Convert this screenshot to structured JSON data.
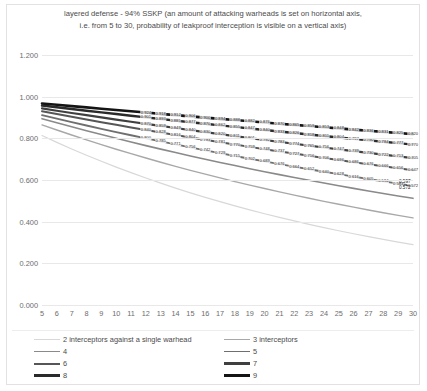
{
  "chart": {
    "title": "layered defense - 94% SSKP (an amount of attacking warheads is set on horizontal axis, i.e. from 5 to 30, probability of leakproof interception is visible on a vertical axis)",
    "title_line1": "layered defense - 94% SSKP (an amount of attacking warheads is set on horizontal axis,",
    "title_line2": "i.e. from 5 to 30, probability of leakproof interception is visible on a vertical axis)"
  },
  "legend": {
    "position": "bottom",
    "items": [
      {
        "label": "2 interceptors against a single warhead",
        "color": "#d8d8d8",
        "width": 1.2
      },
      {
        "label": "3 interceptors",
        "color": "#a8a8a8",
        "width": 1.4
      },
      {
        "label": "4",
        "color": "#8a8a8a",
        "width": 1.6
      },
      {
        "label": "5",
        "color": "#6f6f6f",
        "width": 1.8
      },
      {
        "label": "6",
        "color": "#565656",
        "width": 2.0
      },
      {
        "label": "7",
        "color": "#3f3f3f",
        "width": 2.2
      },
      {
        "label": "8",
        "color": "#2a2a2a",
        "width": 2.4
      },
      {
        "label": "9",
        "color": "#141414",
        "width": 2.6
      }
    ]
  },
  "chart_data": {
    "type": "line",
    "title": "layered defense - 94% SSKP (an amount of attacking warheads is set on horizontal axis, i.e. from 5 to 30, probability of leakproof interception is visible on a vertical axis)",
    "xlabel": "",
    "ylabel": "",
    "xlim": [
      5,
      30
    ],
    "ylim": [
      0.0,
      1.2
    ],
    "yticks": [
      "0.000",
      "0.200",
      "0.400",
      "0.600",
      "0.800",
      "1.000",
      "1.200"
    ],
    "ytick_values": [
      0.0,
      0.2,
      0.4,
      0.6,
      0.8,
      1.0,
      1.2
    ],
    "xticks": [
      5,
      6,
      7,
      8,
      9,
      10,
      11,
      12,
      13,
      14,
      15,
      16,
      17,
      18,
      19,
      20,
      21,
      22,
      23,
      24,
      25,
      26,
      27,
      28,
      29,
      30
    ],
    "grid": true,
    "legend_position": "bottom",
    "x": [
      5,
      6,
      7,
      8,
      9,
      10,
      11,
      12,
      13,
      14,
      15,
      16,
      17,
      18,
      19,
      20,
      21,
      22,
      23,
      24,
      25,
      26,
      27,
      28,
      29,
      30
    ],
    "series": [
      {
        "name": "2 interceptors against a single warhead",
        "color": "#d8d8d8",
        "values": [
          0.983,
          0.979,
          0.976,
          0.972,
          0.968,
          0.965,
          0.961,
          0.957,
          0.954,
          0.95,
          0.946,
          0.943,
          0.939,
          0.936,
          0.932,
          0.929,
          0.925,
          0.921,
          0.918,
          0.914,
          0.911,
          0.907,
          0.904,
          0.9,
          0.897,
          0.893
        ],
        "note": "lowest curve, decays from ~0.94 at x=5 to ~0.29 at x=30",
        "endpoint": 0.29
      },
      {
        "name": "3 interceptors",
        "color": "#a8a8a8",
        "endpoint": 0.418
      },
      {
        "name": "4",
        "color": "#8a8a8a",
        "endpoint": 0.512
      },
      {
        "name": "5",
        "color": "#6f6f6f",
        "endpoint": 0.572
      },
      {
        "name": "6",
        "color": "#565656",
        "endpoint": 0.647
      },
      {
        "name": "7",
        "color": "#3f3f3f",
        "endpoint": 0.705
      },
      {
        "name": "8",
        "color": "#2a2a2a",
        "endpoint": 0.77
      },
      {
        "name": "9",
        "color": "#141414",
        "endpoint": 0.82
      }
    ],
    "visible_data_labels": [
      "0.848",
      "0.843",
      "0.820",
      "0.796",
      "0.773",
      "0.748",
      "0.723",
      "0.698",
      "0.673",
      "0.647",
      "0.622",
      "0.597",
      "0.572"
    ],
    "endpoint_labels": [
      "0.597",
      "0.572"
    ]
  }
}
